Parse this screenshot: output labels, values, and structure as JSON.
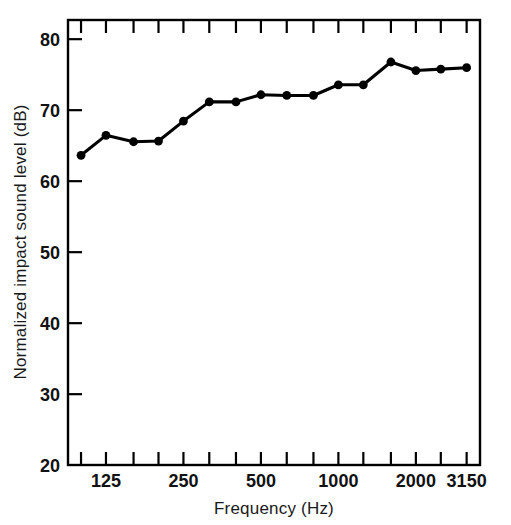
{
  "chart_data": {
    "type": "line",
    "title": "",
    "xlabel": "Frequency (Hz)",
    "ylabel": "Normalized impact sound level (dB)",
    "x_scale": "log",
    "xlim": [
      89,
      3550
    ],
    "ylim": [
      20,
      82.5
    ],
    "grid": false,
    "legend": null,
    "x_tick_labels": [
      "125",
      "250",
      "500",
      "1000",
      "2000",
      "3150"
    ],
    "x_tick_label_values": [
      125,
      250,
      500,
      1000,
      2000,
      3150
    ],
    "y_tick_labels": [
      "20",
      "30",
      "40",
      "50",
      "60",
      "70",
      "80"
    ],
    "y_tick_values": [
      20,
      30,
      40,
      50,
      60,
      70,
      80
    ],
    "x_minor_ticks": [
      100,
      125,
      160,
      200,
      250,
      315,
      400,
      500,
      630,
      800,
      1000,
      1250,
      1600,
      2000,
      2500,
      3150
    ],
    "categories": [
      100,
      125,
      160,
      200,
      250,
      315,
      400,
      500,
      630,
      800,
      1000,
      1250,
      1600,
      2000,
      2500,
      3150
    ],
    "x": [
      100,
      125,
      160,
      200,
      250,
      315,
      400,
      500,
      630,
      800,
      1000,
      1250,
      1600,
      2000,
      2500,
      3150
    ],
    "values": [
      63.5,
      66.3,
      65.4,
      65.5,
      68.3,
      71.0,
      71.0,
      72.0,
      71.9,
      71.9,
      73.4,
      73.4,
      76.6,
      75.4,
      75.6,
      75.8
    ],
    "series": [
      {
        "name": "Normalized impact sound level",
        "values": [
          63.5,
          66.3,
          65.4,
          65.5,
          68.3,
          71.0,
          71.0,
          72.0,
          71.9,
          71.9,
          73.4,
          73.4,
          76.6,
          75.4,
          75.6,
          75.8
        ]
      }
    ],
    "marker": "filled-circle",
    "line_color": "#000000",
    "marker_color": "#000000",
    "background_color": "#ffffff"
  }
}
